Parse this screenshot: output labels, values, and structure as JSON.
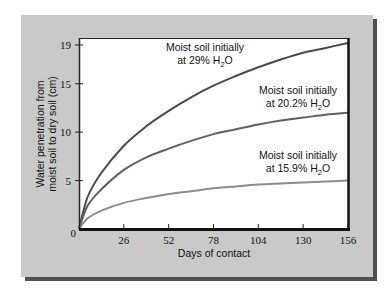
{
  "chart_data": {
    "type": "line",
    "title": "",
    "xlabel": "Days of contact",
    "ylabel": "Water penetration from moist soil to dry soil (cm)",
    "ylabel_lines": [
      "Water penetration from",
      "moist soil to dry soil (cm)"
    ],
    "xlim": [
      0,
      156
    ],
    "ylim": [
      0,
      19
    ],
    "x_ticks": [
      0,
      26,
      52,
      78,
      104,
      130,
      156
    ],
    "x_tick_labels": [
      "26",
      "52",
      "78",
      "104",
      "130",
      "156"
    ],
    "y_ticks": [
      0,
      5,
      10,
      15,
      19
    ],
    "y_tick_labels": [
      "0",
      "5",
      "10",
      "15",
      "19"
    ],
    "grid": false,
    "legend": "inline annotations",
    "x": [
      0,
      5,
      13,
      26,
      39,
      52,
      65,
      78,
      91,
      104,
      117,
      130,
      143,
      156
    ],
    "series": [
      {
        "name": "Moist soil initially at 29% H2O",
        "label_line1": "Moist soil initially",
        "label_line2": "at 29% H",
        "label_sub": "2",
        "label_end": "O",
        "color": "#4a4a4a",
        "values": [
          0,
          3.3,
          5.8,
          8.6,
          10.6,
          12.2,
          13.6,
          14.8,
          15.8,
          16.7,
          17.5,
          18.2,
          18.7,
          19.2
        ]
      },
      {
        "name": "Moist soil initially at 20.2% H2O",
        "label_line1": "Moist soil initially",
        "label_line2": "at 20.2% H",
        "label_sub": "2",
        "label_end": "O",
        "color": "#606060",
        "values": [
          0,
          2.4,
          4.1,
          6.1,
          7.4,
          8.3,
          9.1,
          9.8,
          10.3,
          10.8,
          11.2,
          11.5,
          11.8,
          12.0
        ]
      },
      {
        "name": "Moist soil initially at 15.9% H2O",
        "label_line1": "Moist soil initially",
        "label_line2": "at 15.9% H",
        "label_sub": "2",
        "label_end": "O",
        "color": "#8c8c8c",
        "values": [
          0,
          1.1,
          1.9,
          2.7,
          3.2,
          3.6,
          3.9,
          4.2,
          4.4,
          4.6,
          4.7,
          4.8,
          4.9,
          5.0
        ]
      }
    ]
  }
}
